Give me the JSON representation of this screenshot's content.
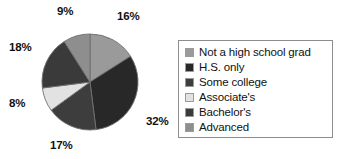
{
  "chart_data": {
    "type": "pie",
    "title": "",
    "subtitle": "",
    "xlabel": "",
    "ylabel": "",
    "grid": false,
    "legend_position": "right",
    "start_angle_deg": 0,
    "direction": "clockwise",
    "categories": [
      "Not a high school grad",
      "H.S. only",
      "Some college",
      "Associate's",
      "Bachelor's",
      "Advanced"
    ],
    "values": [
      16,
      32,
      17,
      8,
      18,
      9
    ],
    "value_labels": [
      "16%",
      "32%",
      "17%",
      "8%",
      "18%",
      "9%"
    ],
    "colors": [
      "#9a9a9a",
      "#282828",
      "#3d3d3d",
      "#e2e2e2",
      "#3a3a3a",
      "#8e8e8e"
    ],
    "slice_border_color": "#6f6f6f",
    "total": 100
  },
  "pie": {
    "labels": {
      "not_hs_grad": "16%",
      "hs_only": "32%",
      "some_college": "17%",
      "associates": "8%",
      "bachelors": "18%",
      "advanced": "9%"
    }
  },
  "legend": {
    "border_color": "#8d8d8d",
    "items": [
      {
        "label": "Not a high school grad",
        "color": "#9a9a9a"
      },
      {
        "label": "H.S. only",
        "color": "#282828"
      },
      {
        "label": "Some college",
        "color": "#3d3d3d"
      },
      {
        "label": "Associate's",
        "color": "#e2e2e2"
      },
      {
        "label": "Bachelor's",
        "color": "#3a3a3a"
      },
      {
        "label": "Advanced",
        "color": "#8e8e8e"
      }
    ]
  }
}
